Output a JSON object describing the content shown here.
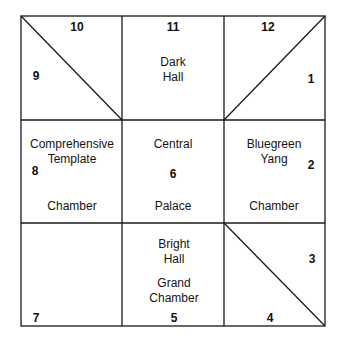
{
  "diagram": {
    "type": "nine-palace grid (Mingtang)",
    "cells": [
      {
        "position": "top-left",
        "numbers": [
          "10",
          "9"
        ],
        "label_lines": [],
        "diagonal": "top-left to bottom-right"
      },
      {
        "position": "top-center",
        "numbers": [
          "11"
        ],
        "label_lines": [
          "Dark",
          "Hall"
        ]
      },
      {
        "position": "top-right",
        "numbers": [
          "12",
          "1"
        ],
        "label_lines": [],
        "diagonal": "bottom-left to top-right"
      },
      {
        "position": "middle-left",
        "numbers": [
          "8"
        ],
        "label_lines": [
          "Comprehensive",
          "Template",
          "Chamber"
        ]
      },
      {
        "position": "center",
        "numbers": [
          "6"
        ],
        "label_lines": [
          "Central",
          "Palace"
        ]
      },
      {
        "position": "middle-right",
        "numbers": [
          "2"
        ],
        "label_lines": [
          "Bluegreen",
          "Yang",
          "Chamber"
        ]
      },
      {
        "position": "bottom-left",
        "numbers": [
          "7"
        ],
        "label_lines": []
      },
      {
        "position": "bottom-center",
        "numbers": [
          "5"
        ],
        "label_lines": [
          "Bright",
          "Hall",
          "Grand",
          "Chamber"
        ]
      },
      {
        "position": "bottom-right",
        "numbers": [
          "3",
          "4"
        ],
        "label_lines": [],
        "diagonal": "top-left to bottom-right"
      }
    ]
  },
  "numbers": {
    "n1": "1",
    "n2": "2",
    "n3": "3",
    "n4": "4",
    "n5": "5",
    "n6": "6",
    "n7": "7",
    "n8": "8",
    "n9": "9",
    "n10": "10",
    "n11": "11",
    "n12": "12"
  },
  "labels": {
    "dark": "Dark",
    "hall_top": "Hall",
    "comprehensive": "Comprehensive",
    "template": "Template",
    "chamber_left": "Chamber",
    "central": "Central",
    "palace": "Palace",
    "bluegreen": "Bluegreen",
    "yang": "Yang",
    "chamber_right": "Chamber",
    "bright": "Bright",
    "hall_bottom": "Hall",
    "grand": "Grand",
    "chamber_bottom": "Chamber"
  },
  "colors": {
    "line": "#1a1a1a",
    "background": "#ffffff",
    "text": "#151515"
  }
}
